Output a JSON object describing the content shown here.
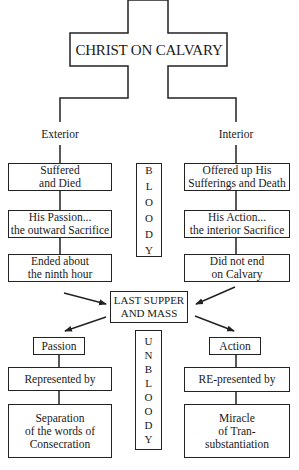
{
  "title": "CHRIST ON CALVARY",
  "branches": {
    "left_label": "Exterior",
    "right_label": "Interior"
  },
  "left_column": [
    {
      "line1": "Suffered",
      "line2": "and Died"
    },
    {
      "line1": "His Passion...",
      "line2": "the outward Sacrifice"
    },
    {
      "line1": "Ended about",
      "line2": "the ninth hour"
    }
  ],
  "right_column": [
    {
      "line1": "Offered up His",
      "line2": "Sufferings and Death"
    },
    {
      "line1": "His Action...",
      "line2": "the interior Sacrifice"
    },
    {
      "line1": "Did not end",
      "line2": "on Calvary"
    }
  ],
  "bloody": [
    "B",
    "L",
    "O",
    "O",
    "D",
    "Y"
  ],
  "center": {
    "line1": "LAST SUPPER",
    "line2": "AND MASS"
  },
  "lower_left": {
    "head": "Passion",
    "middle": "Represented by",
    "bottom": {
      "line1": "Separation",
      "line2": "of the words of",
      "line3": "Consecration"
    }
  },
  "lower_right": {
    "head": "Action",
    "middle": "RE-presented by",
    "bottom": {
      "line1": "Miracle",
      "line2": "of Tran-",
      "line3": "substantiation"
    }
  },
  "unbloody": [
    "U",
    "N",
    "B",
    "L",
    "O",
    "O",
    "D",
    "Y"
  ]
}
